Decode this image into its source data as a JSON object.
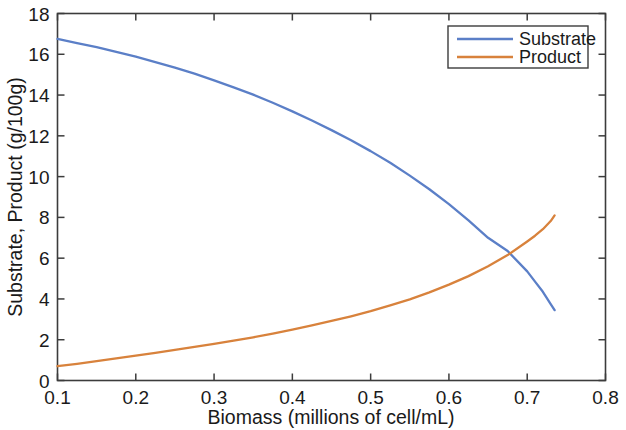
{
  "chart_data": {
    "type": "line",
    "title": "",
    "xlabel": "Biomass (millions of cell/mL)",
    "ylabel": "Substrate, Product (g/100g)",
    "xlim": [
      0.1,
      0.8
    ],
    "ylim": [
      0,
      18
    ],
    "xticks": [
      0.1,
      0.2,
      0.3,
      0.4,
      0.5,
      0.6,
      0.7,
      0.8
    ],
    "xtick_labels": [
      "0.1",
      "0.2",
      "0.3",
      "0.4",
      "0.5",
      "0.6",
      "0.7",
      "0.8"
    ],
    "yticks": [
      0,
      2,
      4,
      6,
      8,
      10,
      12,
      14,
      16,
      18
    ],
    "ytick_labels": [
      "0",
      "2",
      "4",
      "6",
      "8",
      "10",
      "12",
      "14",
      "16",
      "18"
    ],
    "grid": false,
    "legend_position": "top-right",
    "x": [
      0.1,
      0.125,
      0.15,
      0.175,
      0.2,
      0.225,
      0.25,
      0.275,
      0.3,
      0.325,
      0.35,
      0.375,
      0.4,
      0.425,
      0.45,
      0.475,
      0.5,
      0.525,
      0.55,
      0.575,
      0.6,
      0.625,
      0.65,
      0.675,
      0.7,
      0.71,
      0.72,
      0.73,
      0.735
    ],
    "series": [
      {
        "name": "Substrate",
        "color": "#5b7fc7",
        "values": [
          16.75,
          16.55,
          16.35,
          16.12,
          15.88,
          15.62,
          15.35,
          15.05,
          14.72,
          14.38,
          14.02,
          13.62,
          13.2,
          12.75,
          12.28,
          11.78,
          11.25,
          10.68,
          10.05,
          9.38,
          8.65,
          7.85,
          7.0,
          6.35,
          5.35,
          4.85,
          4.35,
          3.75,
          3.45
        ]
      },
      {
        "name": "Product",
        "color": "#d8823c",
        "values": [
          0.7,
          0.82,
          0.95,
          1.08,
          1.22,
          1.35,
          1.5,
          1.65,
          1.8,
          1.96,
          2.12,
          2.3,
          2.5,
          2.7,
          2.92,
          3.15,
          3.4,
          3.68,
          3.98,
          4.32,
          4.7,
          5.12,
          5.6,
          6.15,
          6.82,
          7.1,
          7.42,
          7.82,
          8.1
        ]
      }
    ],
    "crossing_point": {
      "x": 0.683,
      "y": 6.2
    }
  },
  "legend": {
    "entries": [
      {
        "label": "Substrate"
      },
      {
        "label": "Product"
      }
    ]
  }
}
